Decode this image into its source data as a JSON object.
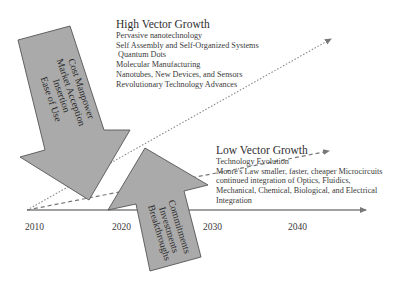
{
  "diagram": {
    "high_vector": {
      "title": "High Vector Growth",
      "items": [
        "Pervasive nanotechnology",
        "Self Assembly and Self-Organized Systems",
        " Quantum Dots",
        "Molecular Manufacturing",
        "Nanotubes, New Devices, and Sensors",
        "Revolutionary Technology Advances"
      ]
    },
    "low_vector": {
      "title": "Low Vector Growth",
      "items": [
        "Technology Evolution",
        "Moore's Law smaller, faster, cheaper Microcircuits",
        "continued integration of Optics, Fluidics,",
        "Mechanical, Chemical, Biological, and Electrical",
        "Integration"
      ]
    },
    "down_arrow": {
      "lines": [
        "Cost Manpower",
        "Market Acception",
        "Insertion",
        "Ease of Use"
      ]
    },
    "up_arrow": {
      "lines": [
        "Commitments",
        "Investments",
        "Breakthroughs"
      ]
    },
    "axis": {
      "ticks": [
        "2010",
        "2020",
        "2030",
        "2040"
      ]
    },
    "colors": {
      "arrow_fill": "#aaaaaa",
      "arrow_stroke": "#555555",
      "line": "#777777"
    }
  }
}
